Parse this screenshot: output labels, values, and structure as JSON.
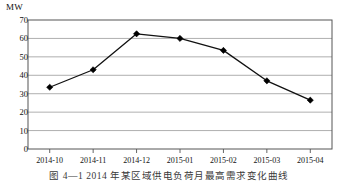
{
  "figure": {
    "unit_label": "MW",
    "caption": "图 4—1  2014 年某区域供电负荷月最高需求变化曲线"
  },
  "chart_data": {
    "type": "line",
    "title": "",
    "subtitle": "",
    "xlabel": "",
    "ylabel": "MW",
    "categories": [
      "2014-10",
      "2014-11",
      "2014-12",
      "2015-01",
      "2015-02",
      "2015-03",
      "2015-04"
    ],
    "values": [
      33.5,
      43.0,
      62.5,
      60.0,
      53.5,
      37.0,
      26.5
    ],
    "series": [
      {
        "name": "",
        "values": [
          33.5,
          43.0,
          62.5,
          60.0,
          53.5,
          37.0,
          26.5
        ]
      }
    ],
    "ylim": [
      0,
      70
    ],
    "yticks": [
      0,
      10,
      20,
      30,
      40,
      50,
      60,
      70
    ],
    "ytick_labels": [
      "0",
      "10",
      "20",
      "30",
      "40",
      "50",
      "60",
      "70"
    ],
    "grid": "horizontal",
    "legend": "none",
    "marker": "diamond",
    "line_color": "#111111",
    "marker_color": "#000000",
    "grid_color": "#9a9a9a",
    "border_color": "#555555"
  }
}
